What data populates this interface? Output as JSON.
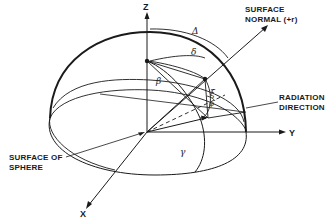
{
  "diagram": {
    "type": "3d-hemisphere-geometry",
    "axes": {
      "z": "Z",
      "y": "Y",
      "x": "X"
    },
    "labels": {
      "surface_normal_line1": "SURFACE",
      "surface_normal_line2": "NORMAL (+r)",
      "radiation_line1": "RADIATION",
      "radiation_line2": "DIRECTION",
      "sphere_line1": "SURFACE OF",
      "sphere_line2": "SPHERE"
    },
    "angles": {
      "Delta": "Δ",
      "delta": "δ",
      "beta": "β",
      "xi": "ξ",
      "phi": "φ",
      "gamma": "γ"
    },
    "colors": {
      "ink": "#1a1a1a",
      "background": "#ffffff"
    }
  }
}
